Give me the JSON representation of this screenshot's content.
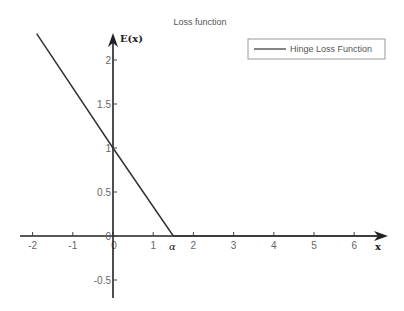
{
  "chart_data": {
    "type": "line",
    "title": "Loss function",
    "xlabel": "x",
    "ylabel": "E(x)",
    "xlim": [
      -2.2,
      6.8
    ],
    "ylim": [
      -0.75,
      2.3
    ],
    "x_ticks": [
      -2,
      -1,
      0,
      1,
      2,
      3,
      4,
      5,
      6
    ],
    "x_tick_labels": [
      "-2",
      "-1",
      "0",
      "1",
      "2",
      "3",
      "4",
      "5",
      "6"
    ],
    "y_ticks": [
      2,
      1.5,
      1,
      0.5,
      0,
      -0.5
    ],
    "y_tick_labels": [
      "2",
      "1.5",
      "1",
      "0.5",
      "0",
      "-0.5"
    ],
    "annotations": [
      {
        "text": "α",
        "x": 1.5,
        "y": 0,
        "position": "below"
      }
    ],
    "grid": false,
    "legend_position": "upper right",
    "series": [
      {
        "name": "Hinge Loss Function",
        "color": "#333333",
        "x": [
          -1.9,
          0,
          1.5,
          6.6
        ],
        "y": [
          2.3,
          1.0,
          0,
          0
        ]
      }
    ]
  },
  "legend": {
    "label": "Hinge Loss Function"
  },
  "colors": {
    "axis": "#222222",
    "line": "#333333",
    "text": "#666666"
  }
}
